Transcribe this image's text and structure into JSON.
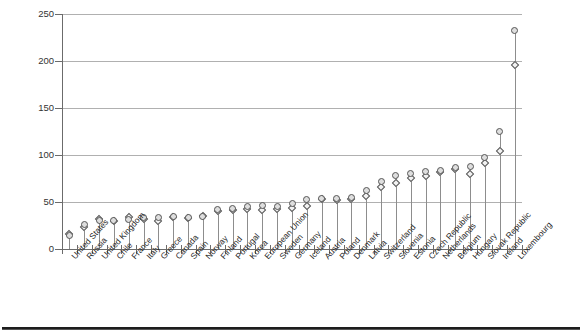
{
  "chart_data": {
    "type": "scatter",
    "title": "",
    "subtitle": "",
    "xlabel": "",
    "ylabel": "",
    "ylim": [
      0,
      250
    ],
    "yticks": [
      0,
      50,
      100,
      150,
      200,
      250
    ],
    "grid": true,
    "legend_position": "none",
    "categories": [
      "United States",
      "Russia",
      "United Kingdom",
      "Chile",
      "France",
      "Italy",
      "Greece",
      "Canada",
      "Spain",
      "Norway",
      "Finland",
      "Portugal",
      "Korea",
      "European Union",
      "Sweden",
      "Germany",
      "Iceland",
      "Austria",
      "Poland",
      "Denmark",
      "Latvia",
      "Switzerland",
      "Slovenia",
      "Estonia",
      "Czech Republic",
      "Netherlands",
      "Belgium",
      "Hungary",
      "Slovak Republic",
      "Ireland",
      "Luxembourg"
    ],
    "series": [
      {
        "name": "circle-series",
        "marker": "circle",
        "values": [
          14,
          26,
          30,
          30,
          31,
          33,
          33,
          35,
          34,
          35,
          42,
          43,
          45,
          46,
          45,
          48,
          53,
          54,
          54,
          55,
          62,
          72,
          78,
          80,
          82,
          84,
          87,
          88,
          97,
          125,
          232
        ]
      },
      {
        "name": "diamond-series",
        "marker": "diamond",
        "values": [
          16,
          23,
          32,
          30,
          34,
          32,
          30,
          34,
          33,
          35,
          40,
          42,
          43,
          42,
          43,
          44,
          46,
          53,
          52,
          53,
          56,
          66,
          70,
          76,
          78,
          82,
          85,
          80,
          92,
          104,
          196
        ]
      }
    ]
  }
}
